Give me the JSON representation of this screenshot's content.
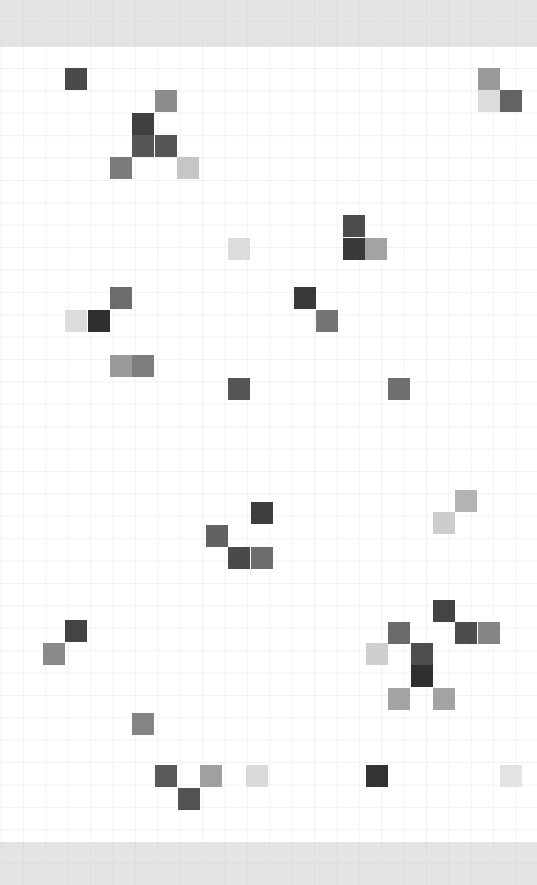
{
  "canvas": {
    "width": 537,
    "height": 885,
    "background_color": "#ffffff",
    "band_color": "#e4e4e4",
    "gridline_color": "#f2f2f2",
    "band_gridline_color": "#dedede",
    "top_band_height": 47,
    "bottom_band_top": 842,
    "bottom_band_height": 43,
    "grid_origin_x": 0.6,
    "grid_origin_y": 45.6,
    "cell_size": 22.4
  },
  "chart_data": {
    "type": "heatmap",
    "title": "",
    "subtitle": "",
    "xlabel": "",
    "ylabel": "",
    "grid": true,
    "legend": "none",
    "cell_size": 22.4,
    "columns": 24,
    "rows": 36,
    "colorscale": "grayscale",
    "cells": [
      {
        "col": 3,
        "row": 1,
        "x": 65,
        "y": 68,
        "color": "#4a4a4a"
      },
      {
        "col": 21,
        "row": 1,
        "x": 478,
        "y": 68,
        "color": "#9a9a9a"
      },
      {
        "col": 7,
        "row": 2,
        "x": 155,
        "y": 90,
        "color": "#8d8d8d"
      },
      {
        "col": 21,
        "row": 2,
        "x": 478,
        "y": 90,
        "color": "#dcdcdc"
      },
      {
        "col": 22,
        "row": 2,
        "x": 500,
        "y": 90,
        "color": "#636363"
      },
      {
        "col": 6,
        "row": 3,
        "x": 132,
        "y": 113,
        "color": "#3f3f3f"
      },
      {
        "col": 6,
        "row": 4,
        "x": 132,
        "y": 135,
        "color": "#565656"
      },
      {
        "col": 7,
        "row": 4,
        "x": 155,
        "y": 135,
        "color": "#565656"
      },
      {
        "col": 5,
        "row": 5,
        "x": 110,
        "y": 157,
        "color": "#7b7b7b"
      },
      {
        "col": 8,
        "row": 5,
        "x": 177,
        "y": 157,
        "color": "#c6c6c6"
      },
      {
        "col": 15,
        "row": 8,
        "x": 343,
        "y": 215,
        "color": "#4c4c4c"
      },
      {
        "col": 10,
        "row": 9,
        "x": 228,
        "y": 238,
        "color": "#dcdcdc"
      },
      {
        "col": 15,
        "row": 9,
        "x": 343,
        "y": 238,
        "color": "#3a3a3a"
      },
      {
        "col": 16,
        "row": 9,
        "x": 365,
        "y": 238,
        "color": "#a3a3a3"
      },
      {
        "col": 5,
        "row": 11,
        "x": 110,
        "y": 287,
        "color": "#6c6c6c"
      },
      {
        "col": 13,
        "row": 11,
        "x": 294,
        "y": 287,
        "color": "#393939"
      },
      {
        "col": 3,
        "row": 12,
        "x": 65,
        "y": 310,
        "color": "#dcdcdc"
      },
      {
        "col": 4,
        "row": 12,
        "x": 88,
        "y": 310,
        "color": "#2f2f2f"
      },
      {
        "col": 14,
        "row": 12,
        "x": 316,
        "y": 310,
        "color": "#757575"
      },
      {
        "col": 5,
        "row": 14,
        "x": 110,
        "y": 355,
        "color": "#9a9a9a"
      },
      {
        "col": 6,
        "row": 14,
        "x": 132,
        "y": 355,
        "color": "#7e7e7e"
      },
      {
        "col": 10,
        "row": 15,
        "x": 228,
        "y": 378,
        "color": "#555555"
      },
      {
        "col": 17,
        "row": 15,
        "x": 388,
        "y": 378,
        "color": "#6f6f6f"
      },
      {
        "col": 20,
        "row": 20,
        "x": 455,
        "y": 490,
        "color": "#b3b3b3"
      },
      {
        "col": 11,
        "row": 21,
        "x": 251,
        "y": 502,
        "color": "#3e3e3e"
      },
      {
        "col": 19,
        "row": 21,
        "x": 433,
        "y": 512,
        "color": "#cdcdcd"
      },
      {
        "col": 9,
        "row": 22,
        "x": 206,
        "y": 525,
        "color": "#626262"
      },
      {
        "col": 10,
        "row": 23,
        "x": 228,
        "y": 547,
        "color": "#4a4a4a"
      },
      {
        "col": 11,
        "row": 23,
        "x": 251,
        "y": 547,
        "color": "#6d6d6d"
      },
      {
        "col": 19,
        "row": 25,
        "x": 433,
        "y": 600,
        "color": "#444444"
      },
      {
        "col": 3,
        "row": 26,
        "x": 65,
        "y": 620,
        "color": "#444444"
      },
      {
        "col": 17,
        "row": 26,
        "x": 388,
        "y": 622,
        "color": "#6a6a6a"
      },
      {
        "col": 20,
        "row": 26,
        "x": 455,
        "y": 622,
        "color": "#4d4d4d"
      },
      {
        "col": 21,
        "row": 26,
        "x": 478,
        "y": 622,
        "color": "#858585"
      },
      {
        "col": 2,
        "row": 27,
        "x": 43,
        "y": 643,
        "color": "#8a8a8a"
      },
      {
        "col": 16,
        "row": 27,
        "x": 366,
        "y": 643,
        "color": "#cfcfcf"
      },
      {
        "col": 18,
        "row": 27,
        "x": 411,
        "y": 643,
        "color": "#4e4e4e"
      },
      {
        "col": 18,
        "row": 28,
        "x": 411,
        "y": 665,
        "color": "#2f2f2f"
      },
      {
        "col": 17,
        "row": 29,
        "x": 388,
        "y": 688,
        "color": "#a3a3a3"
      },
      {
        "col": 19,
        "row": 29,
        "x": 433,
        "y": 688,
        "color": "#a3a3a3"
      },
      {
        "col": 6,
        "row": 30,
        "x": 132,
        "y": 713,
        "color": "#848484"
      },
      {
        "col": 7,
        "row": 32,
        "x": 155,
        "y": 765,
        "color": "#595959"
      },
      {
        "col": 9,
        "row": 32,
        "x": 200,
        "y": 765,
        "color": "#a0a0a0"
      },
      {
        "col": 11,
        "row": 32,
        "x": 246,
        "y": 765,
        "color": "#dadada"
      },
      {
        "col": 16,
        "row": 32,
        "x": 366,
        "y": 765,
        "color": "#333333"
      },
      {
        "col": 22,
        "row": 32,
        "x": 500,
        "y": 765,
        "color": "#e3e3e3"
      },
      {
        "col": 8,
        "row": 33,
        "x": 178,
        "y": 788,
        "color": "#525252"
      }
    ]
  }
}
